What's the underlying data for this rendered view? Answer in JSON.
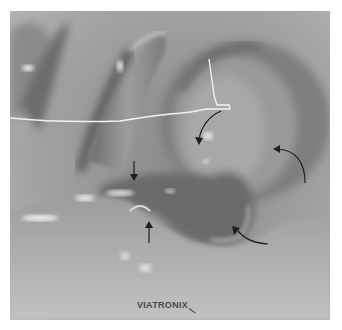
{
  "image": {
    "subject": "virtual colonoscopy 3D endoluminal rendering",
    "watermark": "VIATRONIX",
    "annotations": {
      "centerline": {
        "color": "#f2f2f2"
      },
      "arrows": [
        {
          "type": "curved",
          "direction": "down",
          "label": "arrow-to-fold-center"
        },
        {
          "type": "straight",
          "direction": "down",
          "label": "arrow-upper-fold"
        },
        {
          "type": "straight",
          "direction": "up",
          "label": "arrow-lower-fold"
        },
        {
          "type": "curved",
          "direction": "left",
          "label": "arrow-right-upper"
        },
        {
          "type": "curved",
          "direction": "up-left",
          "label": "arrow-right-lower"
        }
      ],
      "arrow_color": "#1e1e1e"
    }
  }
}
